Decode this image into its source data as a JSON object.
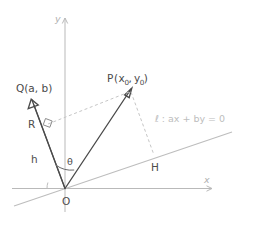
{
  "figure": {
    "kind": "geometry-diagram",
    "title_text": "",
    "background": "#ffffff"
  },
  "axes": {
    "x_label": "x",
    "y_label": "y",
    "origin_label": "O",
    "axis_color": "#b9b9b9"
  },
  "line": {
    "label": "ℓ :  ax + by = 0",
    "color": "#bdbdbd"
  },
  "points": {
    "Q": {
      "name": "Q",
      "open_paren": "(",
      "coord_x": "a",
      "comma": ", ",
      "coord_y": "b",
      "close_paren": ")",
      "full": "Q(a, b)"
    },
    "P": {
      "name": "P",
      "open_paren": "(",
      "coord_x": "x",
      "coord_x_sub": "0",
      "comma": ", ",
      "coord_y": "y",
      "coord_y_sub": "0",
      "close_paren": ")",
      "full": "P(x₀, y₀)"
    },
    "H": {
      "label": "H"
    },
    "R": {
      "label": "R"
    }
  },
  "segments": {
    "h_label": "h",
    "theta_label": "θ"
  },
  "colors": {
    "vector": "#4a4a4a",
    "dashed": "#c6c6c6",
    "gray_line": "#bdbdbd",
    "text": "#4d4d4d"
  }
}
